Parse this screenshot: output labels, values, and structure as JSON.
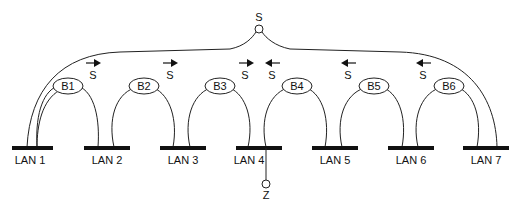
{
  "diagram": {
    "root_node": {
      "label": "S",
      "x": 259,
      "y": 29
    },
    "leaf_node": {
      "label": "Z",
      "x": 266,
      "y": 184
    },
    "lans": [
      {
        "label": "LAN 1",
        "x1": 12,
        "x2": 53
      },
      {
        "label": "LAN 2",
        "x1": 84,
        "x2": 130
      },
      {
        "label": "LAN 3",
        "x1": 160,
        "x2": 206
      },
      {
        "label": "LAN 4",
        "x1": 236,
        "x2": 282
      },
      {
        "label": "LAN 5",
        "x1": 312,
        "x2": 358
      },
      {
        "label": "LAN 6",
        "x1": 388,
        "x2": 434
      },
      {
        "label": "LAN 7",
        "x1": 463,
        "x2": 509
      }
    ],
    "bridges": [
      {
        "label": "B1",
        "x": 68
      },
      {
        "label": "B2",
        "x": 144
      },
      {
        "label": "B3",
        "x": 220
      },
      {
        "label": "B4",
        "x": 297
      },
      {
        "label": "B5",
        "x": 374
      },
      {
        "label": "B6",
        "x": 449
      }
    ],
    "arrows": [
      {
        "label": "S",
        "direction": "right",
        "x": 93
      },
      {
        "label": "S",
        "direction": "right",
        "x": 170
      },
      {
        "label": "S",
        "direction": "right",
        "x": 245
      },
      {
        "label": "S",
        "direction": "left",
        "x": 272
      },
      {
        "label": "S",
        "direction": "left",
        "x": 348
      },
      {
        "label": "S",
        "direction": "left",
        "x": 423
      }
    ]
  }
}
